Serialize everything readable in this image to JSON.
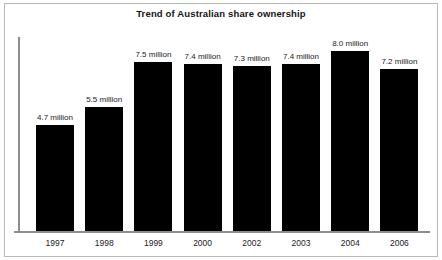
{
  "chart_data": {
    "type": "bar",
    "title": "Trend of Australian share ownership",
    "xlabel": "",
    "ylabel": "",
    "unit": "million",
    "grid": false,
    "legend": false,
    "axis_color": "#8d8d8d",
    "bar_color": "#000000",
    "background": "#ffffff",
    "border_color": "#b9b9b9",
    "ylim": [
      0,
      8.6
    ],
    "categories": [
      "1997",
      "1998",
      "1999",
      "2000",
      "2002",
      "2003",
      "2004",
      "2006"
    ],
    "values": [
      4.7,
      5.5,
      7.5,
      7.4,
      7.3,
      7.4,
      8.0,
      7.2
    ],
    "value_labels": [
      "4.7 million",
      "5.5 million",
      "7.5 million",
      "7.4 million",
      "7.3 million",
      "7.4 million",
      "8.0 million",
      "7.2 million"
    ],
    "bars": [
      {
        "category": "1997",
        "value": 4.7,
        "label": "4.7 million"
      },
      {
        "category": "1998",
        "value": 5.5,
        "label": "5.5 million"
      },
      {
        "category": "1999",
        "value": 7.5,
        "label": "7.5 million"
      },
      {
        "category": "2000",
        "value": 7.4,
        "label": "7.4 million"
      },
      {
        "category": "2002",
        "value": 7.3,
        "label": "7.3 million"
      },
      {
        "category": "2003",
        "value": 7.4,
        "label": "7.4 million"
      },
      {
        "category": "2004",
        "value": 8.0,
        "label": "8.0 million"
      },
      {
        "category": "2006",
        "value": 7.2,
        "label": "7.2 million"
      }
    ]
  }
}
